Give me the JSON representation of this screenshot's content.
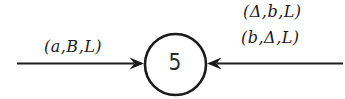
{
  "figure": {
    "type": "state-transition-diagram",
    "background_color": "#ffffff",
    "ink_color": "#1b1b1b",
    "state": {
      "label": "5"
    },
    "left_transition": {
      "label": "(a,B,L)",
      "arrow_direction": "points right into state"
    },
    "right_transition": {
      "labels": [
        "(Δ,b,L)",
        "(b,Δ,L)"
      ],
      "arrow_direction": "points left into state"
    }
  }
}
